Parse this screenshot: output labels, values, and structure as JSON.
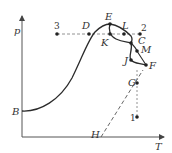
{
  "diagram": {
    "type": "phase-diagram",
    "axes": {
      "y_label": "p",
      "x_label": "T"
    },
    "colors": {
      "line": "#2b2b2b",
      "dashed": "#555555",
      "background": "#ffffff"
    },
    "points": [
      {
        "id": "B",
        "label": "B",
        "x": 22,
        "y": 111
      },
      {
        "id": "3",
        "label": "3",
        "x": 57,
        "y": 34
      },
      {
        "id": "D",
        "label": "D",
        "x": 89,
        "y": 34
      },
      {
        "id": "E",
        "label": "E",
        "x": 110,
        "y": 24
      },
      {
        "id": "K",
        "label": "K",
        "x": 110,
        "y": 34
      },
      {
        "id": "L",
        "label": "L",
        "x": 131,
        "y": 34
      },
      {
        "id": "2",
        "label": "2",
        "x": 140,
        "y": 34
      },
      {
        "id": "C",
        "label": "C",
        "x": 131,
        "y": 43
      },
      {
        "id": "M",
        "label": "M",
        "x": 137,
        "y": 51
      },
      {
        "id": "J",
        "label": "J",
        "x": 131,
        "y": 60
      },
      {
        "id": "F",
        "label": "F",
        "x": 146,
        "y": 65
      },
      {
        "id": "G",
        "label": "G",
        "x": 137,
        "y": 83
      },
      {
        "id": "1",
        "label": "1",
        "x": 137,
        "y": 117
      },
      {
        "id": "H",
        "label": "H",
        "x": 101,
        "y": 137
      }
    ]
  }
}
